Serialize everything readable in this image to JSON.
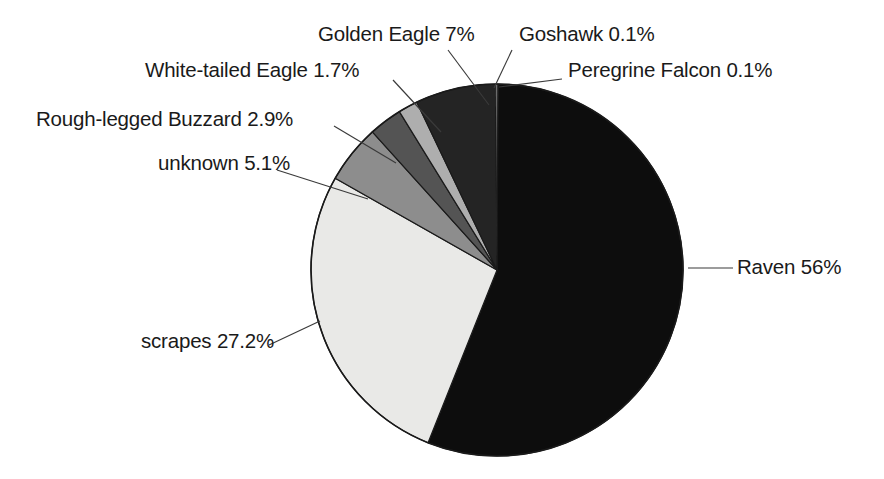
{
  "chart_data": {
    "type": "pie",
    "title": "",
    "subtitle": "",
    "xlabel": "",
    "ylabel": "",
    "legend_position": "none",
    "labels_position": "outside-with-leader-lines",
    "grid": false,
    "start_angle_deg": 0,
    "direction": "clockwise",
    "categories": [
      "Peregrine Falcon",
      "Raven",
      "scrapes",
      "unknown",
      "Rough-legged Buzzard",
      "White-tailed Eagle",
      "Golden Eagle",
      "Goshawk"
    ],
    "values": [
      0.1,
      56,
      27.2,
      5.1,
      2.9,
      1.7,
      7,
      0.1
    ],
    "unit": "%",
    "slices": [
      {
        "name": "Peregrine Falcon",
        "value": 0.1,
        "label": "Peregrine Falcon 0.1%",
        "color": "#ffffff",
        "start_deg": 0,
        "end_deg": 0.36
      },
      {
        "name": "Raven",
        "value": 56,
        "label": "Raven 56%",
        "color": "#0d0d0d",
        "start_deg": 0.36,
        "end_deg": 201.96
      },
      {
        "name": "scrapes",
        "value": 27.2,
        "label": "scrapes 27.2%",
        "color": "#e9e9e7",
        "start_deg": 201.96,
        "end_deg": 299.88
      },
      {
        "name": "unknown",
        "value": 5.1,
        "label": "unknown 5.1%",
        "color": "#8d8d8d",
        "start_deg": 299.88,
        "end_deg": 318.24
      },
      {
        "name": "Rough-legged Buzzard",
        "value": 2.9,
        "label": "Rough-legged Buzzard 2.9%",
        "color": "#545454",
        "start_deg": 318.24,
        "end_deg": 328.68
      },
      {
        "name": "White-tailed Eagle",
        "value": 1.7,
        "label": "White-tailed Eagle 1.7%",
        "color": "#aeaeae",
        "start_deg": 328.68,
        "end_deg": 334.8
      },
      {
        "name": "Golden Eagle",
        "value": 7,
        "label": "Golden Eagle 7%",
        "color": "#242424",
        "start_deg": 334.8,
        "end_deg": 360
      },
      {
        "name": "Goshawk",
        "value": 0.1,
        "label": "Goshawk 0.1%",
        "color": "#ffffff",
        "start_deg": 359.64,
        "end_deg": 360
      }
    ]
  },
  "labels": {
    "golden_eagle": "Golden Eagle 7%",
    "goshawk": "Goshawk 0.1%",
    "white_tailed_eagle": "White-tailed Eagle 1.7%",
    "peregrine_falcon": "Peregrine Falcon 0.1%",
    "rough_legged_buzzard": "Rough-legged Buzzard 2.9%",
    "unknown": "unknown 5.1%",
    "raven": "Raven 56%",
    "scrapes": "scrapes 27.2%"
  },
  "colors": {
    "background": "#ffffff",
    "text": "#1a1a1a",
    "outline": "#1a1a1a",
    "leader_line": "#3a3a3a"
  },
  "geometry": {
    "center_x": 497,
    "center_y": 270,
    "radius": 186
  }
}
